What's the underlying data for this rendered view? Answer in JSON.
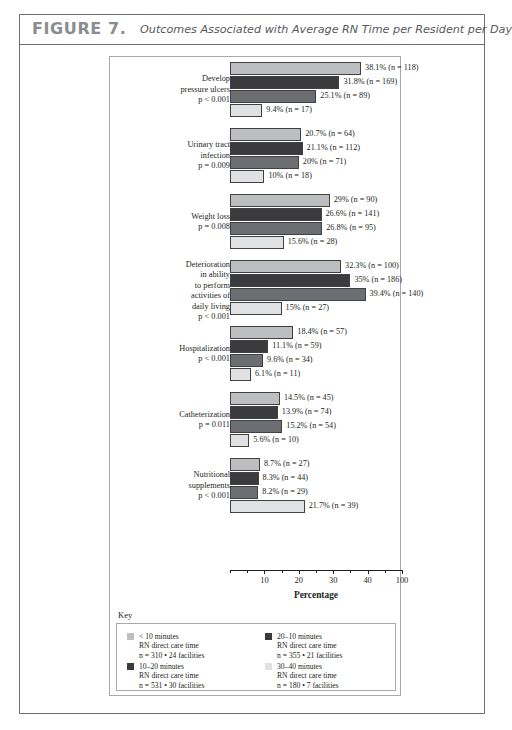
{
  "figure": {
    "number": "FIGURE 7.",
    "caption": "Outcomes Associated with Average RN Time per Resident per Day"
  },
  "chart_data": {
    "type": "bar",
    "orientation": "horizontal",
    "title": "Outcomes Associated with Average RN Time per Resident per Day",
    "xlabel": "Percentage",
    "ylabel": "",
    "xlim": [
      0,
      50
    ],
    "xticks": [
      10,
      20,
      30,
      40,
      100
    ],
    "grid": false,
    "legend_position": "below-axis",
    "series": [
      {
        "name": "< 10 minutes",
        "color": "#bcbec0",
        "values": [
          38.1,
          20.7,
          29,
          32.3,
          18.4,
          14.5,
          8.7
        ],
        "counts": [
          118,
          64,
          90,
          100,
          57,
          45,
          27
        ]
      },
      {
        "name": "10–20 minutes",
        "color": "#3b3b3d",
        "values": [
          31.8,
          21.1,
          26.6,
          35,
          11.1,
          13.9,
          8.3
        ],
        "counts": [
          169,
          112,
          141,
          186,
          59,
          74,
          44
        ]
      },
      {
        "name": "20–10 minutes",
        "color": "#6d6e71",
        "values": [
          25.1,
          20,
          26.8,
          39.4,
          9.6,
          15.2,
          8.2
        ],
        "counts": [
          89,
          71,
          95,
          140,
          34,
          54,
          29
        ]
      },
      {
        "name": "30–40 minutes",
        "color": "#e0e1e2",
        "values": [
          9.4,
          10,
          15.6,
          15,
          6.1,
          5.6,
          21.7
        ],
        "counts": [
          17,
          18,
          28,
          27,
          11,
          10,
          39
        ]
      }
    ],
    "categories": [
      {
        "label_lines": [
          "Develop",
          "pressure ulcers",
          "p < 0.001"
        ],
        "bars": [
          {
            "series": "< 10 minutes",
            "value": 38.1,
            "n": 118,
            "data_label": "38.1% (n = 118)"
          },
          {
            "series": "10–20 minutes",
            "value": 31.8,
            "n": 169,
            "data_label": "31.8% (n = 169)"
          },
          {
            "series": "20–10 minutes",
            "value": 25.1,
            "n": 89,
            "data_label": "25.1% (n = 89)"
          },
          {
            "series": "30–40 minutes",
            "value": 9.4,
            "n": 17,
            "data_label": "9.4% (n = 17)"
          }
        ]
      },
      {
        "label_lines": [
          "Urinary tract",
          "infection",
          "p = 0.009"
        ],
        "bars": [
          {
            "series": "< 10 minutes",
            "value": 20.7,
            "n": 64,
            "data_label": "20.7% (n = 64)"
          },
          {
            "series": "10–20 minutes",
            "value": 21.1,
            "n": 112,
            "data_label": "21.1% (n = 112)"
          },
          {
            "series": "20–10 minutes",
            "value": 20,
            "n": 71,
            "data_label": "20% (n = 71)"
          },
          {
            "series": "30–40 minutes",
            "value": 10,
            "n": 18,
            "data_label": "10% (n = 18)"
          }
        ]
      },
      {
        "label_lines": [
          "Weight loss",
          "p = 0.008"
        ],
        "bars": [
          {
            "series": "< 10 minutes",
            "value": 29,
            "n": 90,
            "data_label": "29% (n = 90)"
          },
          {
            "series": "10–20 minutes",
            "value": 26.6,
            "n": 141,
            "data_label": "26.6% (n = 141)"
          },
          {
            "series": "20–10 minutes",
            "value": 26.8,
            "n": 95,
            "data_label": "26.8% (n = 95)"
          },
          {
            "series": "30–40 minutes",
            "value": 15.6,
            "n": 28,
            "data_label": "15.6% (n = 28)"
          }
        ]
      },
      {
        "label_lines": [
          "Deterioration",
          "in ability",
          "to perform",
          "activities of",
          "daily living",
          "p < 0.001"
        ],
        "bars": [
          {
            "series": "< 10 minutes",
            "value": 32.3,
            "n": 100,
            "data_label": "32.3% (n = 100)"
          },
          {
            "series": "10–20 minutes",
            "value": 35,
            "n": 186,
            "data_label": "35% (n = 186)"
          },
          {
            "series": "20–10 minutes",
            "value": 39.4,
            "n": 140,
            "data_label": "39.4% (n = 140)"
          },
          {
            "series": "30–40 minutes",
            "value": 15,
            "n": 27,
            "data_label": "15% (n = 27)"
          }
        ]
      },
      {
        "label_lines": [
          "Hospitalization",
          "p < 0.001"
        ],
        "bars": [
          {
            "series": "< 10 minutes",
            "value": 18.4,
            "n": 57,
            "data_label": "18.4% (n = 57)"
          },
          {
            "series": "10–20 minutes",
            "value": 11.1,
            "n": 59,
            "data_label": "11.1% (n = 59)"
          },
          {
            "series": "20–10 minutes",
            "value": 9.6,
            "n": 34,
            "data_label": "9.6% (n = 34)"
          },
          {
            "series": "30–40 minutes",
            "value": 6.1,
            "n": 11,
            "data_label": "6.1% (n = 11)"
          }
        ]
      },
      {
        "label_lines": [
          "Catheterization",
          "p = 0.011"
        ],
        "bars": [
          {
            "series": "< 10 minutes",
            "value": 14.5,
            "n": 45,
            "data_label": "14.5% (n = 45)"
          },
          {
            "series": "10–20 minutes",
            "value": 13.9,
            "n": 74,
            "data_label": "13.9% (n = 74)"
          },
          {
            "series": "20–10 minutes",
            "value": 15.2,
            "n": 54,
            "data_label": "15.2% (n = 54)"
          },
          {
            "series": "30–40 minutes",
            "value": 5.6,
            "n": 10,
            "data_label": "5.6% (n = 10)"
          }
        ]
      },
      {
        "label_lines": [
          "Nutritional",
          "supplements",
          "p < 0.001"
        ],
        "bars": [
          {
            "series": "< 10 minutes",
            "value": 8.7,
            "n": 27,
            "data_label": "8.7% (n = 27)"
          },
          {
            "series": "10–20 minutes",
            "value": 8.3,
            "n": 44,
            "data_label": "8.3% (n = 44)"
          },
          {
            "series": "20–10 minutes",
            "value": 8.2,
            "n": 29,
            "data_label": "8.2% (n = 29)"
          },
          {
            "series": "30–40 minutes",
            "value": 21.7,
            "n": 39,
            "data_label": "21.7% (n = 39)"
          }
        ]
      }
    ]
  },
  "axis": {
    "title": "Percentage",
    "tick_labels": [
      "10",
      "20",
      "30",
      "40",
      "100"
    ]
  },
  "key": {
    "title": "Key",
    "items": [
      {
        "swatch_color": "#bcbec0",
        "line1": "< 10 minutes",
        "line2": "RN direct care time",
        "line3": "n = 310 • 24 facilities"
      },
      {
        "swatch_color": "#3b3b3d",
        "line1": "20–10 minutes",
        "line2": "RN direct care time",
        "line3": "n = 355 • 21 facilities"
      },
      {
        "swatch_color": "#3b3b3d",
        "line1": "10–20 minutes",
        "line2": "RN direct care time",
        "line3": "n = 531 • 30 facilities"
      },
      {
        "swatch_color": "#e0e1e2",
        "line1": "30–40 minutes",
        "line2": "RN direct care time",
        "line3": "n = 180 • 7 facilities"
      }
    ]
  }
}
